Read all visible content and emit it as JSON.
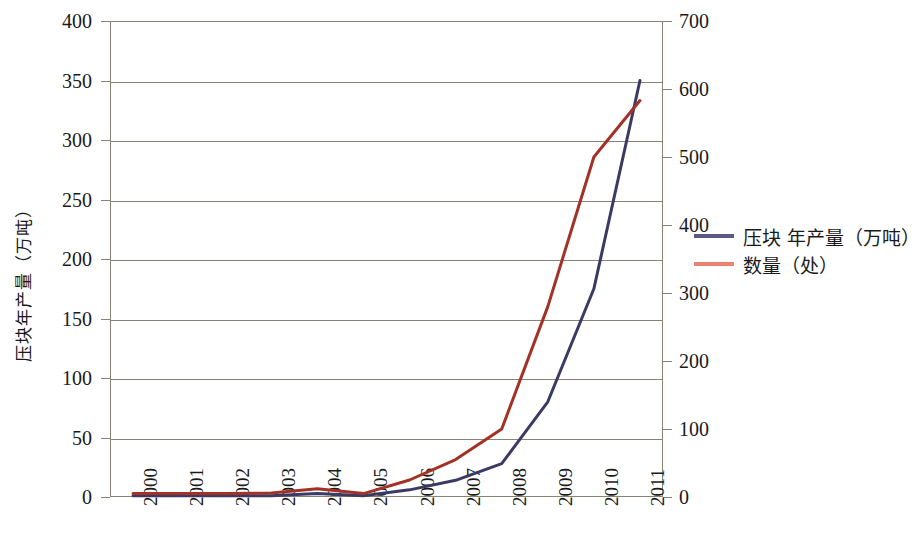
{
  "chart_data": {
    "type": "line",
    "title": "",
    "xlabel": "",
    "ylabel": "压块年产量（万吨）",
    "ylabel_right": "",
    "categories": [
      "2000",
      "2001",
      "2002",
      "2003",
      "2004",
      "2005",
      "2006",
      "2007",
      "2008",
      "2009",
      "2010",
      "2011"
    ],
    "grid": true,
    "legend_position": "right",
    "axes": {
      "left": {
        "label": "压块年产量（万吨）",
        "min": 0,
        "max": 400,
        "step": 50,
        "ticks": [
          "0",
          "50",
          "100",
          "150",
          "200",
          "250",
          "300",
          "350",
          "400"
        ]
      },
      "right": {
        "label": "",
        "min": 0,
        "max": 700,
        "step": 100,
        "ticks": [
          "0",
          "100",
          "200",
          "300",
          "400",
          "500",
          "600",
          "700"
        ]
      }
    },
    "series": [
      {
        "name": "压块 年产量（万吨）",
        "axis": "left",
        "color": "#3b3a64",
        "values": [
          1,
          1,
          1,
          1,
          3,
          1,
          6,
          14,
          28,
          80,
          175,
          350
        ]
      },
      {
        "name": "数量（处）",
        "axis": "right",
        "color": "#a33226",
        "values": [
          5,
          5,
          5,
          6,
          12,
          5,
          25,
          55,
          100,
          280,
          500,
          583
        ]
      }
    ],
    "legend": [
      {
        "label": "压块 年产量（万吨）",
        "color": "#5a5a86"
      },
      {
        "label": "数量（处）",
        "color": "#e8836f"
      }
    ]
  },
  "colors": {
    "axis": "#8a8275",
    "grid": "#8a8275",
    "text": "#1a1a1a",
    "series_blue": "#3b3a64",
    "series_red": "#a33226",
    "legend_blue": "#5a5a86",
    "legend_red": "#e8836f",
    "background": "#ffffff"
  }
}
